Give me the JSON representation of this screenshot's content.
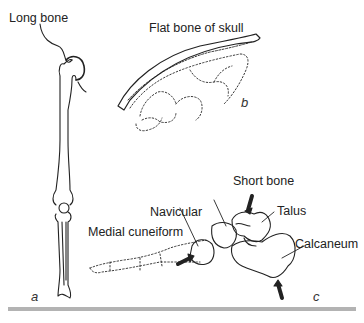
{
  "figure": {
    "panels": [
      {
        "id": "a",
        "label": "a",
        "title": "Long bone"
      },
      {
        "id": "b",
        "label": "b",
        "title": "Flat bone of skull"
      },
      {
        "id": "c",
        "label": "c",
        "title": "Short bone"
      }
    ],
    "labels": {
      "long_bone": "Long bone",
      "flat_bone": "Flat bone of skull",
      "short_bone": "Short bone",
      "talus": "Talus",
      "navicular": "Navicular",
      "medial_cuneiform": "Medial cuneiform",
      "calcaneum": "Calcaneum"
    },
    "panel_letters": {
      "a": "a",
      "b": "b",
      "c": "c"
    },
    "colors": {
      "line": "#222222",
      "bar": "#b3b3b3",
      "background": "#ffffff"
    }
  }
}
